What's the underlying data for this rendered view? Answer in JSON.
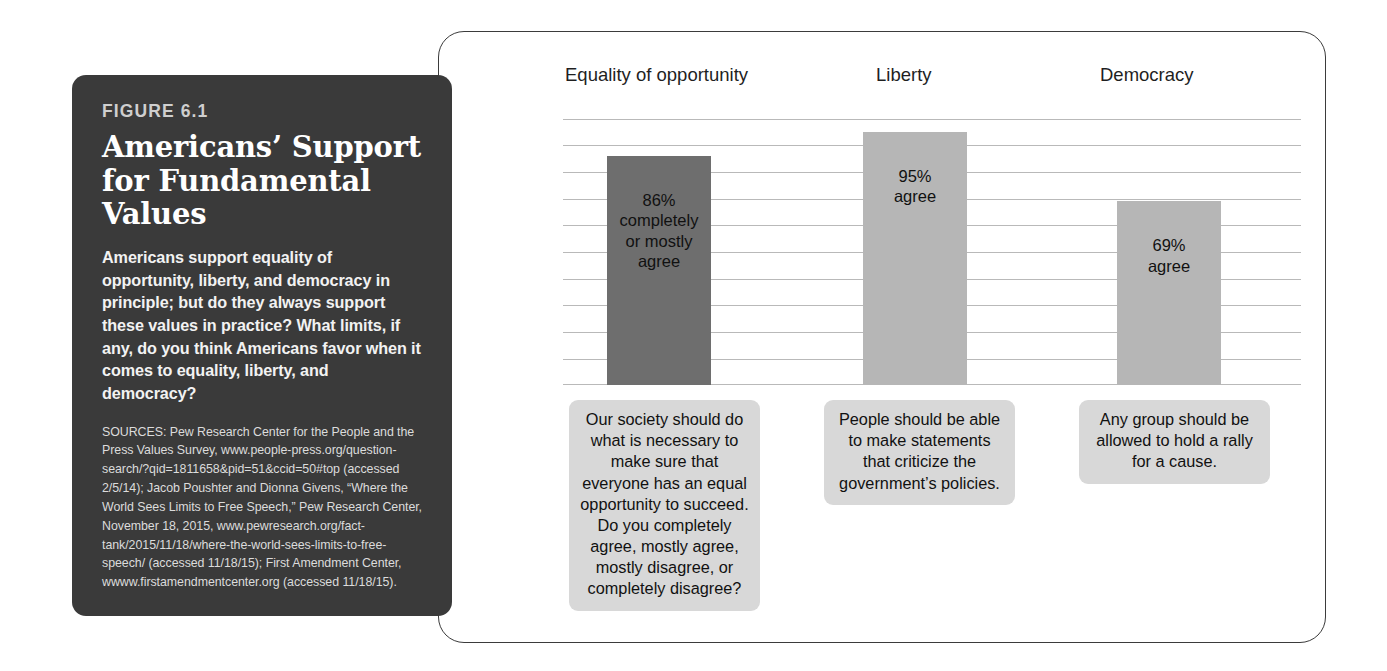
{
  "figure": {
    "label": "FIGURE 6.1",
    "title": "Americans’ Support for Fundamental Values",
    "body": "Americans support equality of opportunity, liberty, and democracy in principle; but do they always support these values in practice? What limits, if any, do you think Americans favor when it comes to equality, liberty, and democracy?",
    "sources": "SOURCES: Pew Research Center for the People and the Press Values Survey, www.people-press.org/question-search/?qid=1811658&pid=51&ccid=50#top (accessed 2/5/14); Jacob Poushter and Dionna Givens, “Where the World Sees Limits to Free Speech,” Pew Research Center, November 18, 2015, www.pewresearch.org/fact-tank/2015/11/18/where-the-world-sees-limits-to-free-speech/ (accessed 11/18/15); First Amendment Center, wwww.firstamendmentcenter.org (accessed 11/18/15)."
  },
  "chart_data": {
    "type": "bar",
    "title": "Americans’ Support for Fundamental Values",
    "xlabel": "",
    "ylabel": "",
    "ylim": [
      0,
      100
    ],
    "grid": true,
    "legend": "none",
    "categories": [
      "Equality of opportunity",
      "Liberty",
      "Democracy"
    ],
    "values": [
      86,
      95,
      69
    ],
    "data_labels": [
      "86% completely or mostly agree",
      "95% agree",
      "69% agree"
    ],
    "bar_colors": [
      "#6e6e6e",
      "#b6b6b6",
      "#b6b6b6"
    ],
    "gridline_count": 11,
    "bars": [
      {
        "category": "Equality of opportunity",
        "value": 86,
        "value_text": "86%",
        "qualifier_lines": [
          "completely",
          "or mostly",
          "agree"
        ],
        "color": "#6e6e6e",
        "question": "Our society should do what is necessary to make sure that everyone has an equal opportunity to succeed. Do you completely agree, mostly agree, mostly disagree, or completely disagree?"
      },
      {
        "category": "Liberty",
        "value": 95,
        "value_text": "95%",
        "qualifier_lines": [
          "agree"
        ],
        "color": "#b6b6b6",
        "question": "People should be able to make statements that criticize the government’s policies."
      },
      {
        "category": "Democracy",
        "value": 69,
        "value_text": "69%",
        "qualifier_lines": [
          "agree"
        ],
        "color": "#b6b6b6",
        "question": "Any group should be allowed to hold a rally for a cause."
      }
    ]
  }
}
